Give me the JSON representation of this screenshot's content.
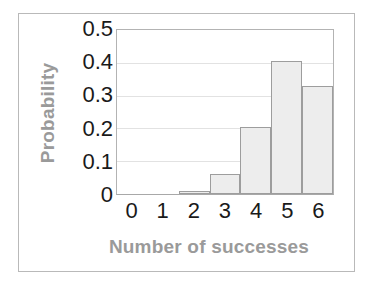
{
  "chart_data": {
    "type": "bar",
    "title": "",
    "xlabel": "Number of successes",
    "ylabel": "Probability",
    "categories": [
      "0",
      "1",
      "2",
      "3",
      "4",
      "5",
      "6"
    ],
    "values": [
      0,
      0,
      0.008,
      0.06,
      0.205,
      0.405,
      0.33
    ],
    "ylim": [
      0,
      0.5
    ],
    "ytick_labels": [
      "0.5",
      "0.4",
      "0.3",
      "0.2",
      "0.1",
      "0"
    ],
    "ytick_values": [
      0.5,
      0.4,
      0.3,
      0.2,
      0.1,
      0
    ],
    "grid": true,
    "grid_orientation": "horizontal",
    "legend": null,
    "legend_position": "none",
    "series": [
      {
        "name": "Probability",
        "values": [
          0,
          0,
          0.008,
          0.06,
          0.205,
          0.405,
          0.33
        ]
      }
    ]
  },
  "style": {
    "bar_fill": "#ededed",
    "bar_border": "#9d9d9d",
    "axis_line": "#b3b3b3",
    "gridline": "#e2e2e2",
    "tick_text": "#1a1a1a",
    "axis_title": "#9a9a9a",
    "frame_border": "#b9b9b9",
    "background": "#ffffff"
  }
}
